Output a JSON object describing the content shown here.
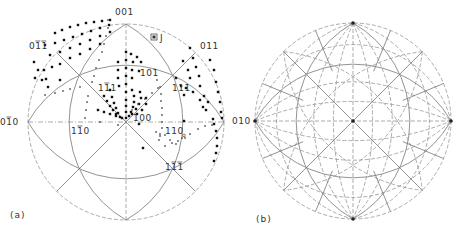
{
  "figure": {
    "panels": [
      {
        "id": "a",
        "caption": "(a)",
        "caption_pos": [
          10,
          218
        ],
        "center": [
          126,
          122
        ],
        "radius": 98,
        "labels": [
          {
            "text": "001",
            "bar": "",
            "x": 115,
            "y": 15,
            "note": "top pole"
          },
          {
            "text": "011",
            "bar": "12",
            "x": 29,
            "y": 49
          },
          {
            "text": "011",
            "bar": "",
            "x": 200,
            "y": 49
          },
          {
            "text": "111",
            "bar": "1",
            "x": 98,
            "y": 91
          },
          {
            "text": "101",
            "bar": "",
            "x": 140,
            "y": 76
          },
          {
            "text": "111",
            "bar": "",
            "x": 172,
            "y": 91
          },
          {
            "text": "010",
            "bar": "1",
            "x": 0,
            "y": 125
          },
          {
            "text": "100",
            "bar": "",
            "x": 133,
            "y": 121
          },
          {
            "text": "110",
            "bar": "1",
            "x": 71,
            "y": 134
          },
          {
            "text": "110",
            "bar": "",
            "x": 165,
            "y": 134,
            "sub": "o"
          },
          {
            "text": "111",
            "bar": "12",
            "x": 165,
            "y": 170
          },
          {
            "text": "J",
            "bar": "",
            "x": 160,
            "y": 41,
            "boxed": true
          }
        ],
        "dots": [
          [
            55,
            33
          ],
          [
            62,
            30
          ],
          [
            70,
            27
          ],
          [
            78,
            25
          ],
          [
            86,
            23
          ],
          [
            94,
            22
          ],
          [
            102,
            21
          ],
          [
            110,
            20
          ],
          [
            45,
            45
          ],
          [
            55,
            43
          ],
          [
            64,
            40
          ],
          [
            73,
            37
          ],
          [
            82,
            34
          ],
          [
            91,
            31
          ],
          [
            100,
            28
          ],
          [
            109,
            25
          ],
          [
            50,
            55
          ],
          [
            60,
            52
          ],
          [
            70,
            48
          ],
          [
            80,
            44
          ],
          [
            90,
            40
          ],
          [
            100,
            36
          ],
          [
            110,
            32
          ],
          [
            44,
            70
          ],
          [
            52,
            67
          ],
          [
            60,
            64
          ],
          [
            70,
            58
          ],
          [
            80,
            54
          ],
          [
            90,
            49
          ],
          [
            100,
            44
          ],
          [
            34,
            62
          ],
          [
            38,
            70
          ],
          [
            42,
            80
          ],
          [
            48,
            87
          ],
          [
            35,
            78
          ],
          [
            46,
            79
          ],
          [
            60,
            80
          ],
          [
            126,
            52
          ],
          [
            131,
            54
          ],
          [
            137,
            57
          ],
          [
            126,
            60
          ],
          [
            133,
            62
          ],
          [
            141,
            62
          ],
          [
            126,
            68
          ],
          [
            132,
            70
          ],
          [
            139,
            71
          ],
          [
            126,
            76
          ],
          [
            132,
            78
          ],
          [
            118,
            62
          ],
          [
            118,
            70
          ],
          [
            118,
            78
          ],
          [
            119,
            86
          ],
          [
            126,
            84
          ],
          [
            126,
            92
          ],
          [
            126,
            100
          ],
          [
            126,
            106
          ],
          [
            126,
            112
          ],
          [
            126,
            118
          ],
          [
            110,
            90
          ],
          [
            112,
            97
          ],
          [
            114,
            103
          ],
          [
            116,
            108
          ],
          [
            118,
            113
          ],
          [
            120,
            117
          ],
          [
            104,
            96
          ],
          [
            107,
            101
          ],
          [
            110,
            106
          ],
          [
            113,
            110
          ],
          [
            116,
            114
          ],
          [
            132,
            90
          ],
          [
            134,
            96
          ],
          [
            134,
            102
          ],
          [
            133,
            107
          ],
          [
            131,
            112
          ],
          [
            129,
            116
          ],
          [
            140,
            92
          ],
          [
            141,
            98
          ],
          [
            139,
            104
          ],
          [
            136,
            109
          ],
          [
            132,
            114
          ],
          [
            146,
            98
          ],
          [
            146,
            104
          ],
          [
            142,
            110
          ],
          [
            137,
            114
          ],
          [
            98,
            110
          ],
          [
            104,
            112
          ],
          [
            110,
            114
          ],
          [
            116,
            116
          ],
          [
            122,
            118
          ],
          [
            190,
            48
          ],
          [
            193,
            58
          ],
          [
            196,
            67
          ],
          [
            199,
            76
          ],
          [
            200,
            86
          ],
          [
            204,
            96
          ],
          [
            203,
            107
          ],
          [
            206,
            110
          ],
          [
            183,
            61
          ],
          [
            188,
            70
          ],
          [
            190,
            78
          ],
          [
            186,
            88
          ],
          [
            193,
            92
          ],
          [
            200,
            100
          ],
          [
            208,
            102
          ],
          [
            210,
            60
          ],
          [
            214,
            70
          ],
          [
            216,
            82
          ],
          [
            218,
            92
          ],
          [
            220,
            102
          ],
          [
            221,
            112
          ],
          [
            222,
            118
          ],
          [
            176,
            78
          ],
          [
            181,
            86
          ],
          [
            184,
            95
          ],
          [
            214,
            124
          ],
          [
            216,
            131
          ],
          [
            217,
            138
          ],
          [
            217,
            146
          ],
          [
            216,
            153
          ],
          [
            214,
            161
          ],
          [
            139,
            124
          ],
          [
            143,
            148
          ],
          [
            184,
            121
          ],
          [
            213,
            119
          ]
        ],
        "crosses": [
          [
            108,
            20
          ],
          [
            108,
            28
          ],
          [
            106,
            36
          ],
          [
            104,
            44
          ],
          [
            102,
            52
          ],
          [
            99,
            60
          ],
          [
            96,
            68
          ],
          [
            94,
            76
          ],
          [
            92,
            82
          ],
          [
            88,
            96
          ],
          [
            87,
            102
          ],
          [
            86,
            110
          ],
          [
            85,
            118
          ],
          [
            45,
            95
          ],
          [
            55,
            93
          ],
          [
            63,
            91
          ],
          [
            70,
            89
          ],
          [
            80,
            87
          ],
          [
            157,
            80
          ],
          [
            160,
            87
          ],
          [
            161,
            94
          ],
          [
            161,
            101
          ],
          [
            162,
            108
          ],
          [
            162,
            115
          ],
          [
            162,
            122
          ],
          [
            162,
            128
          ],
          [
            160,
            134
          ],
          [
            159,
            140
          ],
          [
            132,
            110
          ],
          [
            138,
            104
          ],
          [
            145,
            99
          ],
          [
            152,
            93
          ],
          [
            158,
            88
          ],
          [
            165,
            135
          ],
          [
            170,
            140
          ],
          [
            176,
            144
          ],
          [
            182,
            138
          ],
          [
            190,
            134
          ],
          [
            198,
            129
          ],
          [
            205,
            126
          ],
          [
            212,
            125
          ],
          [
            156,
            132
          ],
          [
            160,
            136
          ],
          [
            165,
            146
          ],
          [
            172,
            143
          ],
          [
            178,
            141
          ],
          [
            185,
            138
          ],
          [
            100,
            122
          ],
          [
            118,
            125
          ]
        ]
      },
      {
        "id": "b",
        "caption": "(b)",
        "caption_pos": [
          256,
          222
        ],
        "center": [
          353,
          121
        ],
        "radius": 98,
        "labels": [
          {
            "text": "010",
            "bar": "",
            "x": 232,
            "y": 124,
            "note": "partially shown left label (edge of panel)"
          }
        ]
      }
    ]
  },
  "chart_data": {
    "type": "stereographic-projection",
    "title": "",
    "panels": [
      {
        "id": "a",
        "caption": "(a)",
        "projection": "cubic stereogram, 100 at centre",
        "poles": [
          "001",
          "0-1-1 (bar)",
          "011",
          "-111 (bar)",
          "101",
          "111",
          "0-10 (bar 010)",
          "100",
          "-110 (bar 110)",
          "110",
          "1-1-1 (bar)"
        ],
        "symbols": {
          "dot": "orientation data (filled circle)",
          "cross": "orientation data (x)",
          "boxed_J": "J marker"
        }
      },
      {
        "id": "b",
        "caption": "(b)",
        "projection": "standard stereographic net of great circles (solid) and small circles (dashed)"
      }
    ]
  }
}
